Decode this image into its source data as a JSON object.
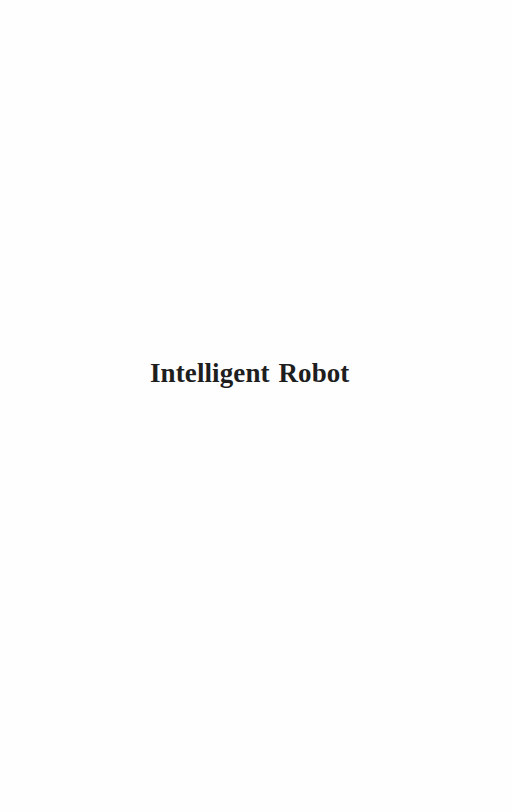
{
  "page": {
    "type": "book-half-title-page",
    "background_color": "#fefefe",
    "title": "Intelligent Robot",
    "title_color": "#1e1e1e"
  }
}
